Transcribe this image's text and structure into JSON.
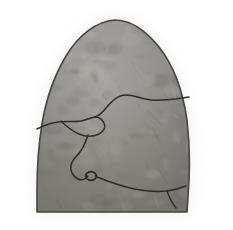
{
  "figure": {
    "domain": "Natural-Image",
    "kind": "grayscale-anatomical-illustration",
    "subject_label": "lung-specimen",
    "caption": "",
    "width_px": 233,
    "height_px": 230,
    "background_color": "#ffffff",
    "colorspace": "grayscale",
    "has_text_labels": false,
    "has_scale_bar": false,
    "has_border": false,
    "cropped_at_bottom": true
  },
  "palette": {
    "background": "#ffffff",
    "halo_shadow": "#d8d8d8",
    "body_light": "#b4b2ae",
    "body_mid": "#9a9894",
    "body_dark": "#7e7c78",
    "body_deep": "#68665f",
    "outline_stroke": "#46443f",
    "fissure_stroke": "#2e2c28",
    "node_stroke": "#262420",
    "texture_light": "#c2c0bb",
    "texture_dark": "#6f6d67"
  },
  "geometry": {
    "apex": {
      "x": 115,
      "y": 20
    },
    "left_base": {
      "x": 38,
      "y": 206
    },
    "right_base": {
      "x": 186,
      "y": 210
    },
    "bottom_crop_y": 212,
    "widest_span_y": 175,
    "left_edge_min_x": 36,
    "right_edge_max_x": 190
  },
  "outline": {
    "name": "specimen-outline",
    "path": "M 115 20 C 96 21, 78 36, 66 56 C 54 76, 46 100, 42 124 C 38 148, 37 172, 37 190 L 37 212 L 187 212 L 188 196 C 190 172, 190 146, 187 120 C 183 92, 174 66, 159 47 C 146 31, 131 20, 115 20 Z",
    "stroke_width": 1.6
  },
  "fissures": [
    {
      "name": "upper-oblique-fissure",
      "path": "M 189 97 C 176 99, 163 101, 151 100 C 141 99, 134 95, 126 95 C 118 95, 112 101, 106 108 C 102 113, 99 116, 95 117",
      "stroke_width": 1.5
    },
    {
      "name": "mid-branch-upper",
      "path": "M 95 117 C 90 118, 86 120, 81 121 C 74 122, 66 121, 58 122 C 50 123, 43 126, 37 129",
      "stroke_width": 1.5
    },
    {
      "name": "mid-branch-triangle",
      "path": "M 61 121 C 66 126, 72 131, 79 134 C 86 137, 93 137, 99 134 C 104 131, 106 127, 104 123 C 102 119, 98 117, 95 117",
      "stroke_width": 1.4
    },
    {
      "name": "lower-descending-fissure",
      "path": "M 88 135 C 86 141, 84 147, 80 152 C 76 157, 72 160, 71 165 C 70 171, 73 176, 78 179 C 82 181, 86 179, 88 176",
      "stroke_width": 1.5
    },
    {
      "name": "basal-fissure",
      "path": "M 97 177 C 107 181, 118 185, 130 188 C 143 191, 156 192, 167 191 C 175 190, 181 188, 186 186",
      "stroke_width": 1.5
    },
    {
      "name": "basal-fissure-tail",
      "path": "M 167 191 C 169 197, 172 203, 176 208",
      "stroke_width": 1.3
    }
  ],
  "node": {
    "name": "hilar-node",
    "cx": 91,
    "cy": 176,
    "rx": 5.2,
    "ry": 4.4,
    "stroke_width": 1.8
  },
  "halo": {
    "name": "edge-shadow",
    "opacity": 0.45,
    "blur_px": 9
  },
  "texture": {
    "grain_count": 170,
    "streak_count": 46,
    "seed": 20231,
    "grain_opacity": 0.2,
    "streak_opacity": 0.26
  }
}
